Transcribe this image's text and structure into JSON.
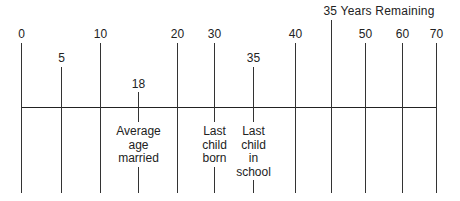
{
  "diagram": {
    "title": "35 Years Remaining",
    "timeline": {
      "y": 107,
      "x_start": 21,
      "x_end": 437,
      "line_bottom": 193
    },
    "ticks": [
      {
        "label": "0",
        "x": 21,
        "label_y": 27,
        "line_top": 43
      },
      {
        "label": "5",
        "x": 61,
        "label_y": 51,
        "line_top": 67
      },
      {
        "label": "10",
        "x": 100,
        "label_y": 27,
        "line_top": 43
      },
      {
        "label": "18",
        "x": 138,
        "label_y": 77,
        "line_top": 92
      },
      {
        "label": "20",
        "x": 177,
        "label_y": 27,
        "line_top": 43
      },
      {
        "label": "30",
        "x": 214,
        "label_y": 27,
        "line_top": 43
      },
      {
        "label": "35",
        "x": 253,
        "label_y": 51,
        "line_top": 67
      },
      {
        "label": "40",
        "x": 295,
        "label_y": 27,
        "line_top": 43
      },
      {
        "label": "",
        "x": 331,
        "label_y": 0,
        "line_top": 20
      },
      {
        "label": "50",
        "x": 365,
        "label_y": 27,
        "line_top": 43
      },
      {
        "label": "60",
        "x": 402,
        "label_y": 27,
        "line_top": 43
      },
      {
        "label": "70",
        "x": 436,
        "label_y": 27,
        "line_top": 43
      }
    ],
    "banner": {
      "text": "35 Years Remaining",
      "x": 379,
      "y": 4
    },
    "events": [
      {
        "text": "Average\nage\nmarried",
        "x": 138,
        "y": 124,
        "gap_top": 122,
        "gap_bottom": 166
      },
      {
        "text": "Last\nchild\nborn",
        "x": 214,
        "y": 124,
        "gap_top": 122,
        "gap_bottom": 166
      },
      {
        "text": "Last\nchild\nin\nschool",
        "x": 253,
        "y": 124,
        "gap_top": 122,
        "gap_bottom": 179
      }
    ]
  }
}
